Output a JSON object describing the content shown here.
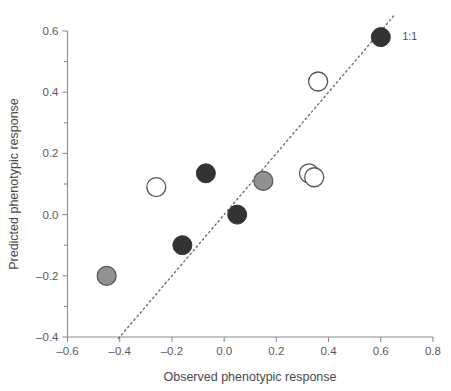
{
  "chart_data": {
    "type": "scatter",
    "title": "",
    "xlabel": "Observed phenotypic response",
    "ylabel": "Predicted phenotypic response",
    "xlim": [
      -0.6,
      0.8
    ],
    "ylim": [
      -0.4,
      0.6
    ],
    "grid": false,
    "legend_position": "none",
    "x_ticks": [
      -0.6,
      -0.4,
      -0.2,
      0.0,
      0.2,
      0.4,
      0.6,
      0.8
    ],
    "x_tick_labels": [
      "–0.6",
      "–0.4",
      "–0.2",
      "0.0",
      "0.2",
      "0.4",
      "0.6",
      "0.8"
    ],
    "y_ticks": [
      -0.4,
      -0.2,
      0.0,
      0.2,
      0.4,
      0.6
    ],
    "y_tick_labels": [
      "–0.4",
      "–0.2",
      "0.0",
      "0.2",
      "0.4",
      "0.6"
    ],
    "y_minor_ticks": [
      -0.3,
      -0.1,
      0.1,
      0.3,
      0.5
    ],
    "colors": {
      "dark_fill": "#333333",
      "gray_fill": "#919191",
      "open_fill": "#ffffff",
      "marker_edge": "#555555",
      "axis": "#8c8c8c",
      "text": "#4a4a4a",
      "reference_line": "#6e6e6e"
    },
    "annotations": [
      {
        "text": "1:1",
        "x": 0.66,
        "y": 0.585
      }
    ],
    "reference_line": {
      "label": "1:1",
      "style": "dotted",
      "x0": -0.405,
      "y0": -0.405,
      "x1": 0.655,
      "y1": 0.655
    },
    "series": [
      {
        "name": "dark filled",
        "marker": "filled-dark",
        "points": [
          {
            "x": -0.16,
            "y": -0.1
          },
          {
            "x": -0.07,
            "y": 0.135
          },
          {
            "x": 0.05,
            "y": 0.0
          },
          {
            "x": 0.6,
            "y": 0.58
          }
        ]
      },
      {
        "name": "gray filled",
        "marker": "filled-gray",
        "points": [
          {
            "x": -0.45,
            "y": -0.2
          },
          {
            "x": 0.15,
            "y": 0.11
          }
        ]
      },
      {
        "name": "open",
        "marker": "open",
        "points": [
          {
            "x": -0.26,
            "y": 0.09
          },
          {
            "x": 0.36,
            "y": 0.435
          },
          {
            "x": 0.325,
            "y": 0.135
          },
          {
            "x": 0.345,
            "y": 0.122
          }
        ]
      }
    ]
  }
}
